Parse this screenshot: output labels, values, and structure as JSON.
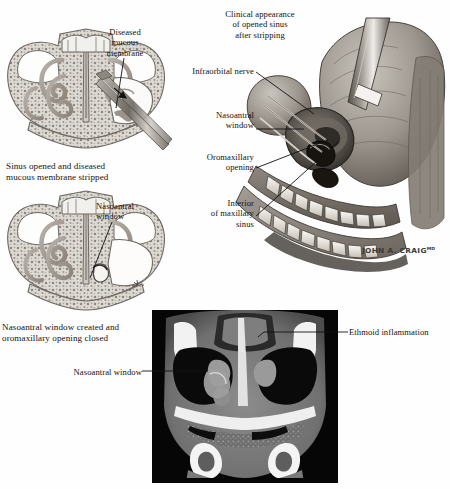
{
  "plate": {
    "background_color": "#fefefe",
    "ink_color": "#15120f",
    "signature": "JOHN A. CRAIG",
    "signature_suffix": "MD"
  },
  "figures": {
    "upper_left": {
      "name": "coronal-sinus-section-stripped",
      "caption": "Sinus opened and diseased\nmucous membrane stripped",
      "labels": [
        {
          "id": "diseased-mucous-membrane",
          "text": "Diseased\nmucous\nmembrane"
        }
      ]
    },
    "lower_left": {
      "name": "coronal-sinus-section-window",
      "caption": "Nasoantral window created and\noromaxillary opening closed",
      "labels": [
        {
          "id": "nasoantral-window",
          "text": "Nasoantral\nwindow"
        }
      ]
    },
    "main_3d": {
      "name": "opened-maxillary-sinus-3d",
      "title": "Clinical appearance\nof opened sinus\nafter stripping",
      "labels": [
        {
          "id": "infraorbital-nerve",
          "text": "Infraorbital nerve"
        },
        {
          "id": "nasoantral-window",
          "text": "Nasoantral\nwindow"
        },
        {
          "id": "oromaxillary-opening",
          "text": "Oromaxillary\nopening"
        },
        {
          "id": "interior-of-maxillary-sinus",
          "text": "Interior\nof maxillary\nsinus"
        }
      ]
    },
    "ct_scan": {
      "name": "coronal-ct-sinus",
      "modality": "CT",
      "plane": "coronal",
      "labels": [
        {
          "id": "ethmoid-inflammation",
          "text": "Ethmoid inflammation"
        },
        {
          "id": "nasoantral-window",
          "text": "Nasoantral window"
        }
      ]
    }
  }
}
